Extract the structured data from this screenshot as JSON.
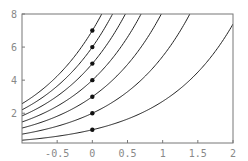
{
  "chart_data": {
    "type": "line",
    "title": "",
    "xlabel": "",
    "ylabel": "",
    "xlim": [
      -1,
      2
    ],
    "ylim": [
      0.2,
      8
    ],
    "grid": false,
    "legend": null,
    "x_ticks": [
      -0.5,
      0,
      0.5,
      1,
      1.5,
      2
    ],
    "x_tick_labels": [
      "-0.5",
      "0",
      "0.5",
      "1",
      "1.5",
      "2"
    ],
    "y_ticks": [
      2,
      4,
      6,
      8
    ],
    "y_tick_labels": [
      "2",
      "4",
      "6",
      "8"
    ],
    "series": [
      {
        "name": "1·e^x",
        "k": 1
      },
      {
        "name": "2·e^x",
        "k": 2
      },
      {
        "name": "3·e^x",
        "k": 3
      },
      {
        "name": "4·e^x",
        "k": 4
      },
      {
        "name": "5·e^x",
        "k": 5
      },
      {
        "name": "6·e^x",
        "k": 6
      },
      {
        "name": "7·e^x",
        "k": 7
      }
    ],
    "points": [
      {
        "x": 0,
        "y": 1
      },
      {
        "x": 0,
        "y": 2
      },
      {
        "x": 0,
        "y": 3
      },
      {
        "x": 0,
        "y": 4
      },
      {
        "x": 0,
        "y": 5
      },
      {
        "x": 0,
        "y": 6
      },
      {
        "x": 0,
        "y": 7
      }
    ],
    "colors": {
      "curve": "#222222",
      "frame": "#777777",
      "point": "#111111",
      "tick_label": "#888888"
    }
  }
}
